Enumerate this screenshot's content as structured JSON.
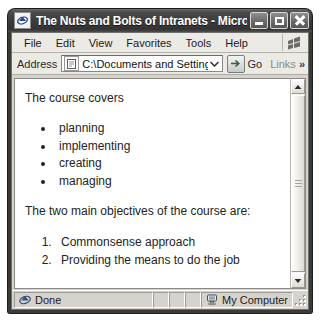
{
  "window": {
    "title": "The Nuts and Bolts of Intranets - Microso...",
    "app_icon": "internet-explorer-icon",
    "buttons": {
      "minimize": "Minimize",
      "maximize": "Maximize",
      "close": "Close"
    }
  },
  "menubar": {
    "items": [
      {
        "label": "File"
      },
      {
        "label": "Edit"
      },
      {
        "label": "View"
      },
      {
        "label": "Favorites"
      },
      {
        "label": "Tools"
      },
      {
        "label": "Help"
      }
    ],
    "brand_icon": "windows-flag-icon"
  },
  "addressbar": {
    "label": "Address",
    "favicon": "page-icon",
    "value": "C:\\Documents and Settings\\defau",
    "dropdown_icon": "chevron-down-icon",
    "go_label": "Go",
    "go_icon": "go-arrow-icon",
    "links_label": "Links",
    "links_chevron": "»"
  },
  "page": {
    "intro": "The course covers",
    "bullets": [
      "planning",
      "implementing",
      "creating",
      "managing"
    ],
    "objectives_intro": "The two main objectives of the course are:",
    "objectives": [
      "Commonsense approach",
      "Providing the means to do the job"
    ]
  },
  "scrollbar": {
    "up_icon": "caret-up-icon",
    "down_icon": "caret-down-icon",
    "thumb_grip": "scrollbar-grip"
  },
  "statusbar": {
    "status_icon": "internet-explorer-icon",
    "status_text": "Done",
    "zone_icon": "my-computer-icon",
    "zone_text": "My Computer",
    "resize_grip": "resize-grip"
  },
  "colors": {
    "titlebar": "#3c3c3c",
    "chrome": "#d6d3cd",
    "toolbar": "#eceae4",
    "page_bg": "#ffffff",
    "text": "#232323"
  }
}
